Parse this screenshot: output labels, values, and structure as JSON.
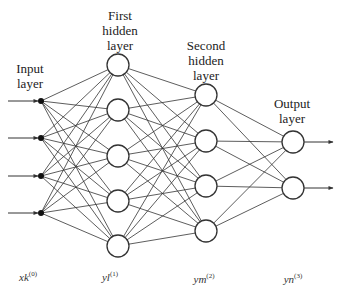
{
  "layers": [
    {
      "id": "input",
      "title": "Input\nlayer",
      "x": 41,
      "nodes": [
        101,
        138,
        176,
        213
      ],
      "type": "dot",
      "variable": {
        "base": "x",
        "sub": "k",
        "sup": "(0)"
      }
    },
    {
      "id": "hidden1",
      "title": "First\nhidden\nlayer",
      "x": 118,
      "nodes": [
        65,
        110,
        156,
        201,
        246
      ],
      "type": "circle",
      "variable": {
        "base": "y",
        "sub": "l",
        "sup": "(1)"
      }
    },
    {
      "id": "hidden2",
      "title": "Second\nhidden\nlayer",
      "x": 206,
      "nodes": [
        95,
        141,
        186,
        231
      ],
      "type": "circle",
      "variable": {
        "base": "y",
        "sub": "m",
        "sup": "(2)"
      }
    },
    {
      "id": "output",
      "title": "Output\nlayer",
      "x": 293,
      "nodes": [
        142,
        188
      ],
      "type": "circle",
      "variable": {
        "base": "y",
        "sub": "n",
        "sup": "(3)"
      }
    }
  ],
  "labels": {
    "input": "Input layer",
    "hidden1": "First hidden layer",
    "hidden2": "Second hidden layer",
    "output": "Output layer"
  },
  "variables": {
    "input": "xk(0)",
    "hidden1": "yl(1)",
    "hidden2": "ym(2)",
    "output": "yn(3)"
  },
  "colors": {
    "stroke": "#333333",
    "background": "#ffffff"
  }
}
